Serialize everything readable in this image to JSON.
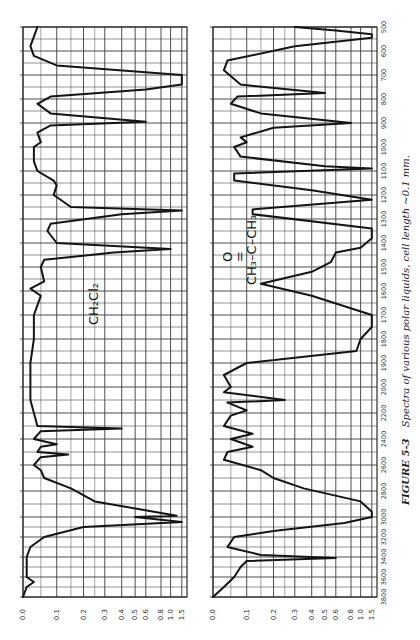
{
  "figure": {
    "caption_number": "FIGURE 5-3",
    "caption_text": "Spectra of various polar liquids, cell length ~0.1 mm."
  },
  "chart_data": [
    {
      "type": "line",
      "title": "CH2Cl2",
      "molecule_label": "CH₂Cl₂",
      "orientation": "rotated 90°: wavenumber runs vertically (500 top → 3800 bottom), absorbance horizontally",
      "xlabel": "Wavenumber (cm⁻¹)",
      "ylabel": "Absorbance",
      "x_ticks": [
        3800,
        3600,
        3400,
        3200,
        3000,
        2800,
        2600,
        2400,
        2200,
        2000,
        1900,
        1800,
        1700,
        1600,
        1500,
        1400,
        1300,
        1200,
        1100,
        1000,
        900,
        800,
        700,
        600,
        500
      ],
      "y_ticks": [
        "0.0",
        "0.1",
        "0.2",
        "0.3",
        "0.4",
        "0.5",
        "0.6",
        "0.8",
        "1.0",
        "1.5"
      ],
      "ylim": [
        0.0,
        1.5
      ],
      "grid": true,
      "series": [
        {
          "name": "CH2Cl2",
          "points": [
            [
              500,
              0.04
            ],
            [
              540,
              0.03
            ],
            [
              580,
              0.02
            ],
            [
              620,
              0.03
            ],
            [
              660,
              0.1
            ],
            [
              700,
              1.5
            ],
            [
              740,
              1.5
            ],
            [
              760,
              0.6
            ],
            [
              790,
              0.08
            ],
            [
              820,
              0.04
            ],
            [
              860,
              0.08
            ],
            [
              895,
              0.6
            ],
            [
              910,
              0.08
            ],
            [
              940,
              0.04
            ],
            [
              980,
              0.05
            ],
            [
              1000,
              0.03
            ],
            [
              1060,
              0.03
            ],
            [
              1100,
              0.04
            ],
            [
              1140,
              0.09
            ],
            [
              1160,
              0.1
            ],
            [
              1200,
              0.09
            ],
            [
              1250,
              0.15
            ],
            [
              1265,
              1.5
            ],
            [
              1280,
              0.4
            ],
            [
              1320,
              0.08
            ],
            [
              1350,
              0.07
            ],
            [
              1400,
              0.1
            ],
            [
              1425,
              1.0
            ],
            [
              1440,
              0.35
            ],
            [
              1470,
              0.06
            ],
            [
              1500,
              0.05
            ],
            [
              1560,
              0.06
            ],
            [
              1590,
              0.02
            ],
            [
              1620,
              0.05
            ],
            [
              1700,
              0.03
            ],
            [
              1800,
              0.03
            ],
            [
              1900,
              0.02
            ],
            [
              2000,
              0.02
            ],
            [
              2100,
              0.02
            ],
            [
              2200,
              0.03
            ],
            [
              2300,
              0.04
            ],
            [
              2320,
              0.4
            ],
            [
              2340,
              0.05
            ],
            [
              2400,
              0.03
            ],
            [
              2440,
              0.1
            ],
            [
              2460,
              0.05
            ],
            [
              2500,
              0.04
            ],
            [
              2520,
              0.14
            ],
            [
              2540,
              0.05
            ],
            [
              2600,
              0.03
            ],
            [
              2640,
              0.05
            ],
            [
              2700,
              0.06
            ],
            [
              2780,
              0.15
            ],
            [
              2880,
              0.25
            ],
            [
              2990,
              1.2
            ],
            [
              3000,
              0.5
            ],
            [
              3050,
              1.5
            ],
            [
              3100,
              0.2
            ],
            [
              3200,
              0.06
            ],
            [
              3300,
              0.02
            ],
            [
              3400,
              0.01
            ],
            [
              3500,
              0.01
            ],
            [
              3600,
              0.01
            ],
            [
              3650,
              0.03
            ],
            [
              3700,
              0.01
            ],
            [
              3800,
              0.0
            ]
          ]
        }
      ]
    },
    {
      "type": "line",
      "title": "Acetone",
      "molecule_label_top": "O",
      "molecule_label_bond": "=",
      "molecule_label_main": "CH₃–C–CH₃",
      "orientation": "rotated 90°: wavenumber runs vertically (500 top → 3800 bottom), absorbance horizontally",
      "xlabel": "Wavenumber (cm⁻¹)",
      "ylabel": "Absorbance",
      "x_ticks": [
        3800,
        3600,
        3400,
        3200,
        3000,
        2800,
        2600,
        2400,
        2200,
        2000,
        1900,
        1800,
        1700,
        1600,
        1500,
        1400,
        1300,
        1200,
        1100,
        1000,
        900,
        800,
        700,
        600,
        500
      ],
      "y_ticks": [
        "0.0",
        "0.1",
        "0.2",
        "0.3",
        "0.4",
        "0.5",
        "0.6",
        "0.8",
        "1.0",
        "1.5"
      ],
      "ylim": [
        0.0,
        1.5
      ],
      "grid": true,
      "series": [
        {
          "name": "Acetone",
          "points": [
            [
              500,
              0.3
            ],
            [
              515,
              0.6
            ],
            [
              530,
              1.5
            ],
            [
              545,
              1.5
            ],
            [
              580,
              0.3
            ],
            [
              640,
              0.04
            ],
            [
              680,
              0.03
            ],
            [
              740,
              0.08
            ],
            [
              775,
              0.5
            ],
            [
              790,
              0.07
            ],
            [
              820,
              0.05
            ],
            [
              860,
              0.15
            ],
            [
              900,
              0.8
            ],
            [
              920,
              0.2
            ],
            [
              960,
              0.08
            ],
            [
              980,
              0.1
            ],
            [
              1000,
              0.06
            ],
            [
              1040,
              0.08
            ],
            [
              1080,
              0.5
            ],
            [
              1090,
              1.5
            ],
            [
              1110,
              0.06
            ],
            [
              1140,
              0.06
            ],
            [
              1180,
              0.4
            ],
            [
              1220,
              1.5
            ],
            [
              1260,
              0.12
            ],
            [
              1280,
              0.12
            ],
            [
              1340,
              1.5
            ],
            [
              1380,
              1.5
            ],
            [
              1420,
              1.0
            ],
            [
              1440,
              0.6
            ],
            [
              1480,
              0.55
            ],
            [
              1520,
              0.4
            ],
            [
              1570,
              0.15
            ],
            [
              1620,
              0.4
            ],
            [
              1700,
              1.5
            ],
            [
              1750,
              1.5
            ],
            [
              1800,
              1.0
            ],
            [
              1850,
              0.9
            ],
            [
              1900,
              0.1
            ],
            [
              1950,
              0.03
            ],
            [
              2000,
              0.05
            ],
            [
              2040,
              0.03
            ],
            [
              2100,
              0.25
            ],
            [
              2120,
              0.04
            ],
            [
              2180,
              0.1
            ],
            [
              2220,
              0.05
            ],
            [
              2300,
              0.03
            ],
            [
              2360,
              0.12
            ],
            [
              2400,
              0.05
            ],
            [
              2460,
              0.12
            ],
            [
              2500,
              0.04
            ],
            [
              2560,
              0.03
            ],
            [
              2640,
              0.15
            ],
            [
              2700,
              0.2
            ],
            [
              2780,
              0.35
            ],
            [
              2880,
              1.0
            ],
            [
              2960,
              1.5
            ],
            [
              3000,
              1.5
            ],
            [
              3060,
              0.7
            ],
            [
              3140,
              0.2
            ],
            [
              3200,
              0.06
            ],
            [
              3300,
              0.04
            ],
            [
              3380,
              0.15
            ],
            [
              3410,
              0.6
            ],
            [
              3440,
              0.1
            ],
            [
              3500,
              0.08
            ],
            [
              3600,
              0.06
            ],
            [
              3700,
              0.03
            ],
            [
              3800,
              0.0
            ]
          ]
        }
      ]
    }
  ]
}
